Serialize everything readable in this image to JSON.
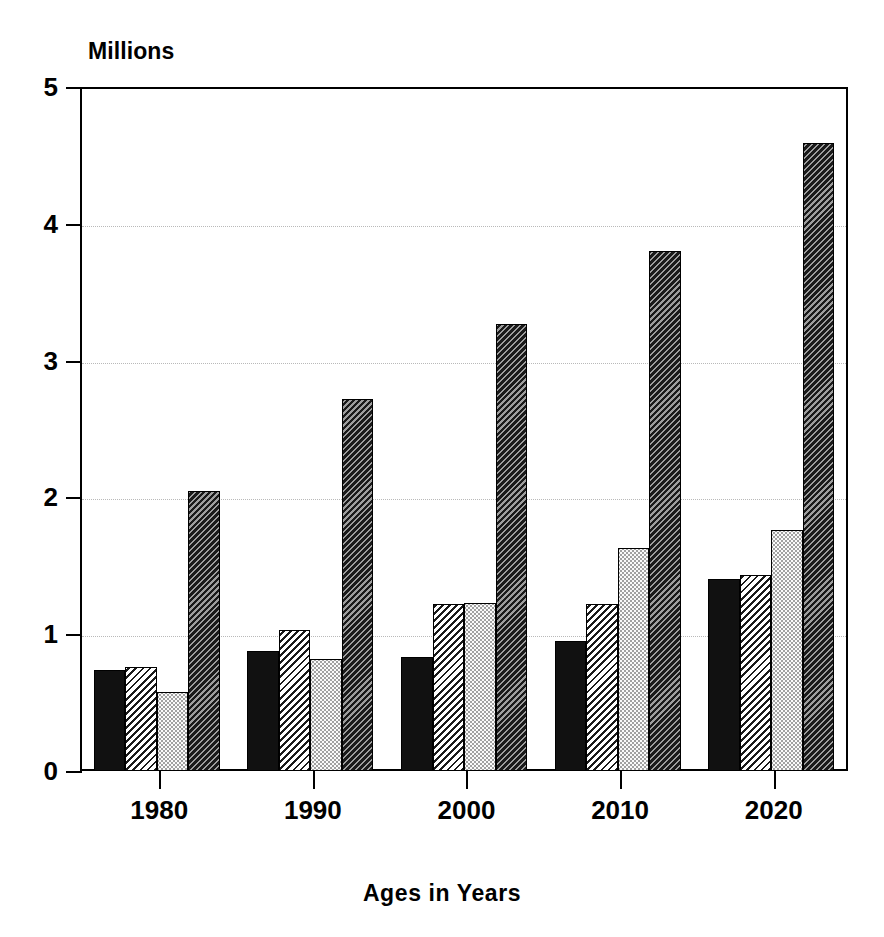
{
  "chart_data": {
    "type": "bar",
    "title": "",
    "ylabel": "Millions",
    "xlabel": "Ages in Years",
    "categories": [
      "1980",
      "1990",
      "2000",
      "2010",
      "2020"
    ],
    "ylim": [
      0,
      5
    ],
    "yticks": [
      "0",
      "1",
      "2",
      "3",
      "4",
      "5"
    ],
    "ytick_values": [
      0,
      1,
      2,
      3,
      4,
      5
    ],
    "grid": true,
    "grid_axis": "y",
    "legend": "none",
    "series": [
      {
        "name": "series-1",
        "pattern": "solid-black",
        "color": "#111111",
        "values": [
          0.74,
          0.88,
          0.83,
          0.95,
          1.4
        ]
      },
      {
        "name": "series-2",
        "pattern": "light-diagonal-hatch",
        "color": "#1a1a1a",
        "values": [
          0.76,
          1.03,
          1.22,
          1.22,
          1.43
        ]
      },
      {
        "name": "series-3",
        "pattern": "light-dotted",
        "color": "#fafafa",
        "values": [
          0.58,
          0.82,
          1.23,
          1.63,
          1.76
        ]
      },
      {
        "name": "series-4",
        "pattern": "dark-diagonal-hatch",
        "color": "#9d9d9d",
        "values": [
          2.05,
          2.72,
          3.27,
          3.8,
          4.59
        ]
      }
    ]
  },
  "axes": {
    "y_title": "Millions",
    "x_title": "Ages in Years"
  },
  "colors": {
    "background": "#ffffff",
    "foreground": "#000000",
    "gridline": "#b9b9b9"
  }
}
